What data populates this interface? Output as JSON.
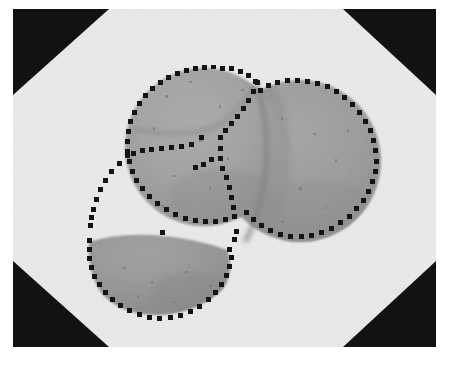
{
  "figure": {
    "caption": "",
    "frame": {
      "x": 13,
      "y": 9,
      "width": 423,
      "height": 338,
      "background_color": "#e9e9e9",
      "corner_color": "#121212",
      "corner_note": "dark triangular vignette in each of the four corners"
    },
    "palette": {
      "background": "#e9e9e9",
      "corner_dark": "#121212",
      "region_fill_light": "#a3a3a3",
      "region_fill_mid": "#9a9a9a",
      "region_fill_dark": "#8d8d8d",
      "seam_shadow": "#7e7e7e",
      "contour_dot": "#141414",
      "page_white": "#ffffff"
    },
    "corners": [
      {
        "name": "top-left",
        "points": "0,0 96,0 0,86"
      },
      {
        "name": "top-right",
        "points": "423,0 330,0 423,86"
      },
      {
        "name": "bottom-left",
        "points": "0,338 0,252 96,338"
      },
      {
        "name": "bottom-right",
        "points": "423,338 423,252 330,338"
      }
    ],
    "regions": [
      {
        "id": "region-upper-left",
        "label": "upper-left round region",
        "shape": "circle",
        "cx": 191,
        "cy": 138,
        "rx": 78,
        "ry": 80,
        "fill": "#a1a1a1",
        "contour": "dotted"
      },
      {
        "id": "region-right",
        "label": "right round region",
        "shape": "circle",
        "cx": 287,
        "cy": 152,
        "rx": 80,
        "ry": 82,
        "fill": "#9a9a9a",
        "contour": "dotted"
      },
      {
        "id": "region-lower",
        "label": "lower half-disc region",
        "shape": "half-disc",
        "cx": 148,
        "cy": 248,
        "rx": 72,
        "ry": 55,
        "fill": "#949494",
        "contour": "dotted"
      }
    ],
    "contours": [
      {
        "id": "contour-upper-left",
        "label": "upper-left region boundary",
        "dot_count": 62,
        "dot_size_px": 4,
        "color": "#141414"
      },
      {
        "id": "contour-right",
        "label": "right region boundary",
        "dot_count": 58,
        "dot_size_px": 4,
        "color": "#141414"
      },
      {
        "id": "contour-lower",
        "label": "lower half-disc boundary",
        "dot_count": 38,
        "dot_size_px": 4,
        "color": "#141414"
      },
      {
        "id": "contour-internal-seam",
        "label": "internal dotted seam inside upper-left region",
        "dot_count": 24,
        "dot_size_px": 4,
        "color": "#141414"
      },
      {
        "id": "contour-left-tail",
        "label": "dotted tail curving down-left from the seam junction",
        "dot_count": 10,
        "dot_size_px": 4,
        "color": "#141414"
      }
    ],
    "speckles": {
      "label": "fine dark speckle texture inside the regions",
      "count": 46,
      "color": "#6d6d6d"
    }
  }
}
